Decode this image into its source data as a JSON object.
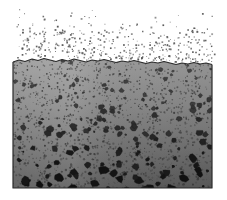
{
  "figure": {
    "width": 227,
    "height": 200,
    "background_color": "#ffffff"
  },
  "colors": {
    "background": "#ffffff",
    "matrix_top": "#9a9a9a",
    "matrix_mid": "#868686",
    "matrix_bottom": "#606060",
    "speckle_dark": "#3a3a3a",
    "speckle_mid": "#4e4e4e",
    "aggregate_fill_top": "#555555",
    "aggregate_fill_bottom": "#111111",
    "aggregate_outline": "#1a1a1a",
    "surface_line": "#2b2b2b",
    "slab_border": "#2b2b2b",
    "spray_dot": "#555555"
  },
  "slab": {
    "label": "granular-slab",
    "left": 13,
    "right": 212,
    "top": 58,
    "bottom": 188,
    "border_width": 1.2,
    "gradient_stops": [
      {
        "offset": 0.0,
        "color": "#9e9e9e"
      },
      {
        "offset": 0.35,
        "color": "#8c8c8c"
      },
      {
        "offset": 0.7,
        "color": "#737373"
      },
      {
        "offset": 1.0,
        "color": "#5c5c5c"
      }
    ]
  },
  "surface": {
    "label": "irregular-top-surface",
    "description": "wavy boundary between spray region and granular body",
    "points": [
      [
        13,
        62
      ],
      [
        19,
        60
      ],
      [
        25,
        61.5
      ],
      [
        32,
        59
      ],
      [
        38,
        60.5
      ],
      [
        44,
        58.5
      ],
      [
        50,
        60
      ],
      [
        56,
        61.5
      ],
      [
        62,
        59.5
      ],
      [
        68,
        61
      ],
      [
        74,
        59
      ],
      [
        80,
        60.5
      ],
      [
        86,
        62
      ],
      [
        92,
        60
      ],
      [
        98,
        61
      ],
      [
        104,
        59.5
      ],
      [
        110,
        61
      ],
      [
        116,
        62.5
      ],
      [
        122,
        61
      ],
      [
        128,
        62
      ],
      [
        134,
        60.5
      ],
      [
        140,
        62
      ],
      [
        146,
        63.5
      ],
      [
        152,
        62
      ],
      [
        158,
        63
      ],
      [
        164,
        61.5
      ],
      [
        170,
        63
      ],
      [
        176,
        64.5
      ],
      [
        182,
        63
      ],
      [
        188,
        64
      ],
      [
        194,
        62.5
      ],
      [
        200,
        64
      ],
      [
        206,
        63
      ],
      [
        212,
        64.5
      ]
    ]
  },
  "spray_region": {
    "label": "suspended-particle-field",
    "top": 2,
    "bottom": 62,
    "left": 16,
    "right": 214,
    "description": "fine dark dots, sparse above, denser near the surface",
    "dot_count": 430,
    "dot_size_min": 0.7,
    "dot_size_max": 1.9,
    "density_profile": "increases toward the surface"
  },
  "matrix_speckles": {
    "label": "fine-speckle-texture",
    "description": "dense small dark dots filling the slab matrix",
    "count": 1650,
    "size_min": 0.8,
    "size_max": 2.1
  },
  "aggregates": {
    "label": "coarse-aggregate-particles",
    "description": "irregular dark blobs, larger and darker toward the bottom",
    "count": 210,
    "size_min": 2.0,
    "size_max": 7.5,
    "size_growth": "increases with depth"
  },
  "legend": {
    "visible": false,
    "entries": []
  },
  "annotations": {
    "visible": false,
    "items": []
  }
}
